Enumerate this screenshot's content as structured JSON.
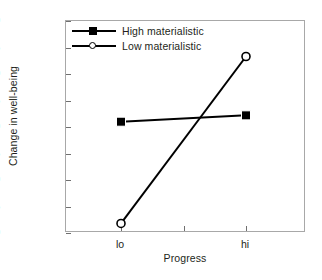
{
  "chart_data": {
    "type": "line",
    "title": "",
    "xlabel": "Progress",
    "ylabel": "Change in well-being",
    "categories": [
      "lo",
      "hi"
    ],
    "ylim": [
      -2.0,
      2.0
    ],
    "ytick_labels": [
      "2.0",
      "1.5",
      "1.0",
      "0.5",
      "0.0",
      "-0.5",
      "-1.0",
      "-1.5",
      "-2.0"
    ],
    "ytick_values": [
      2.0,
      1.5,
      1.0,
      0.5,
      0.0,
      -0.5,
      -1.0,
      -1.5,
      -2.0
    ],
    "grid": false,
    "legend_position": "upper left inside",
    "series": [
      {
        "name": "High materialistic",
        "marker": "filled-square",
        "color": "#000000",
        "values": [
          0.1,
          0.22
        ]
      },
      {
        "name": "Low materialistic",
        "marker": "open-circle",
        "color": "#000000",
        "values": [
          -1.82,
          1.33
        ]
      }
    ]
  },
  "axes": {
    "y_title": "Change in well-being",
    "x_title": "Progress"
  },
  "legend": {
    "entries": [
      {
        "label": "High materialistic",
        "marker": "filled-square-marker"
      },
      {
        "label": "Low materialistic",
        "marker": "open-circle-marker"
      }
    ]
  },
  "colors": {
    "series": "#000000",
    "frame": "#a8a8a8",
    "text": "#231f20"
  }
}
